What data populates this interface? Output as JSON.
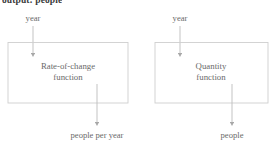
{
  "caption": {
    "text": "output: people"
  },
  "diagram": {
    "line_color": "#b9b9b9",
    "box_border_color": "#c9c9c9",
    "text_color": "#6a6a6a",
    "nodes": [
      {
        "id": "rate-of-change",
        "input_label": "year",
        "box_line1": "Rate-of-change",
        "box_line2": "function",
        "output_label": "people per year"
      },
      {
        "id": "quantity",
        "input_label": "year",
        "box_line1": "Quantity",
        "box_line2": "function",
        "output_label": "people"
      }
    ]
  }
}
